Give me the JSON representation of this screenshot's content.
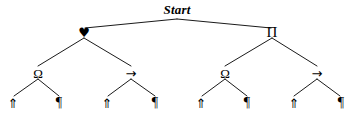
{
  "diagram": {
    "type": "binary-tree",
    "width": 351,
    "height": 116,
    "background_color": "#ffffff",
    "edge_color": "#000000",
    "text_color": "#000000",
    "root": {
      "label": "Start",
      "x": 177,
      "y": 9,
      "apex_x": 177,
      "apex_y": 19
    },
    "level1": [
      {
        "name": "heart-node",
        "label": "♥",
        "x": 84,
        "y": 32
      },
      {
        "name": "pi-node",
        "label": "Π",
        "x": 272,
        "y": 32
      }
    ],
    "level2": [
      {
        "name": "omega-node-1",
        "label": "Ω",
        "x": 38,
        "y": 73
      },
      {
        "name": "arrow-node-1",
        "label": "→",
        "x": 131,
        "y": 73
      },
      {
        "name": "omega-node-2",
        "label": "Ω",
        "x": 225,
        "y": 73
      },
      {
        "name": "arrow-node-2",
        "label": "→",
        "x": 317,
        "y": 73
      }
    ],
    "leaves": [
      {
        "name": "leaf-uparrow-1",
        "label": "⇑",
        "x": 13,
        "y": 103
      },
      {
        "name": "leaf-pilcrow-1",
        "label": "¶",
        "x": 59,
        "y": 103
      },
      {
        "name": "leaf-uparrow-2",
        "label": "⇑",
        "x": 107,
        "y": 103
      },
      {
        "name": "leaf-pilcrow-2",
        "label": "¶",
        "x": 155,
        "y": 103
      },
      {
        "name": "leaf-uparrow-3",
        "label": "⇑",
        "x": 201,
        "y": 103
      },
      {
        "name": "leaf-pilcrow-3",
        "label": "¶",
        "x": 247,
        "y": 103
      },
      {
        "name": "leaf-uparrow-4",
        "label": "⇑",
        "x": 294,
        "y": 103
      },
      {
        "name": "leaf-pilcrow-4",
        "label": "¶",
        "x": 341,
        "y": 103
      }
    ],
    "edges": [
      {
        "name": "edge-root-heart",
        "x1": 177,
        "y1": 19,
        "x2": 85,
        "y2": 28
      },
      {
        "name": "edge-root-pi",
        "x1": 177,
        "y1": 19,
        "x2": 271,
        "y2": 28
      },
      {
        "name": "edge-heart-omega1",
        "x1": 84,
        "y1": 38,
        "x2": 38,
        "y2": 66
      },
      {
        "name": "edge-heart-arrow1",
        "x1": 84,
        "y1": 38,
        "x2": 131,
        "y2": 66
      },
      {
        "name": "edge-pi-omega2",
        "x1": 272,
        "y1": 38,
        "x2": 225,
        "y2": 66
      },
      {
        "name": "edge-pi-arrow2",
        "x1": 272,
        "y1": 38,
        "x2": 317,
        "y2": 66
      },
      {
        "name": "edge-omega1-leaf1",
        "x1": 38,
        "y1": 79,
        "x2": 14,
        "y2": 96
      },
      {
        "name": "edge-omega1-leaf2",
        "x1": 38,
        "y1": 79,
        "x2": 59,
        "y2": 96
      },
      {
        "name": "edge-arrow1-leaf3",
        "x1": 131,
        "y1": 79,
        "x2": 108,
        "y2": 96
      },
      {
        "name": "edge-arrow1-leaf4",
        "x1": 131,
        "y1": 79,
        "x2": 155,
        "y2": 96
      },
      {
        "name": "edge-omega2-leaf5",
        "x1": 225,
        "y1": 79,
        "x2": 202,
        "y2": 96
      },
      {
        "name": "edge-omega2-leaf6",
        "x1": 225,
        "y1": 79,
        "x2": 247,
        "y2": 96
      },
      {
        "name": "edge-arrow2-leaf7",
        "x1": 317,
        "y1": 79,
        "x2": 294,
        "y2": 96
      },
      {
        "name": "edge-arrow2-leaf8",
        "x1": 317,
        "y1": 79,
        "x2": 340,
        "y2": 96
      }
    ]
  }
}
